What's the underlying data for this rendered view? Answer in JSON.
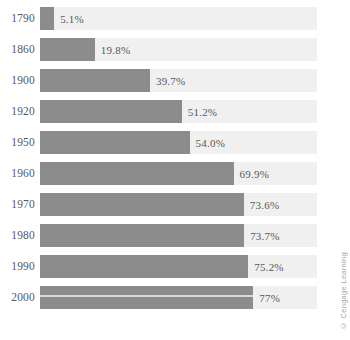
{
  "chart_data": {
    "type": "bar",
    "orientation": "horizontal",
    "title": "",
    "subtitle": "",
    "xlabel": "",
    "ylabel": "",
    "xlim": [
      0,
      100
    ],
    "grid": false,
    "legend": null,
    "categories": [
      "1790",
      "1860",
      "1900",
      "1920",
      "1950",
      "1960",
      "1970",
      "1980",
      "1990",
      "2000"
    ],
    "values": [
      5.1,
      19.8,
      39.7,
      51.2,
      54.0,
      69.9,
      73.6,
      73.7,
      75.2,
      77
    ],
    "value_labels": [
      "5.1%",
      "19.8%",
      "39.7%",
      "51.2%",
      "54.0%",
      "69.9%",
      "73.6%",
      "73.7%",
      "75.2%",
      "77%"
    ],
    "rows": [
      {
        "year": "1790",
        "value": 5.1,
        "label": "5.1%",
        "seam": false
      },
      {
        "year": "1860",
        "value": 19.8,
        "label": "19.8%",
        "seam": false
      },
      {
        "year": "1900",
        "value": 39.7,
        "label": "39.7%",
        "seam": false
      },
      {
        "year": "1920",
        "value": 51.2,
        "label": "51.2%",
        "seam": false
      },
      {
        "year": "1950",
        "value": 54.0,
        "label": "54.0%",
        "seam": false
      },
      {
        "year": "1960",
        "value": 69.9,
        "label": "69.9%",
        "seam": false
      },
      {
        "year": "1970",
        "value": 73.6,
        "label": "73.6%",
        "seam": false
      },
      {
        "year": "1980",
        "value": 73.7,
        "label": "73.7%",
        "seam": false
      },
      {
        "year": "1990",
        "value": 75.2,
        "label": "75.2%",
        "seam": false
      },
      {
        "year": "2000",
        "value": 77,
        "label": "77%",
        "seam": true
      }
    ]
  },
  "credit": {
    "text": "© Cengage Learning"
  },
  "colors": {
    "bar": "#8c8c8c",
    "track": "#f0f0f0",
    "text": "#58585a",
    "credit": "#a8a8a8",
    "background": "#ffffff"
  }
}
